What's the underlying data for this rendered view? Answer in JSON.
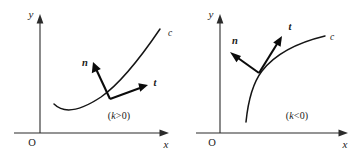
{
  "figure": {
    "background_color": "#ffffff",
    "axis_color": "#2b2b2b",
    "curve_color": "#151515",
    "vector_color": "#0b0b0b"
  },
  "panels": [
    {
      "id": "left",
      "condition_prefix": "(",
      "condition_symbol": "k",
      "condition_relation": ">0)",
      "condition_label": "(k>0)",
      "axes": {
        "x_label": "x",
        "y_label": "y",
        "origin_label": "O"
      },
      "curve_label": "c",
      "vectors": [
        {
          "name": "n",
          "label": "n"
        },
        {
          "name": "t",
          "label": "t"
        }
      ]
    },
    {
      "id": "right",
      "condition_prefix": "(",
      "condition_symbol": "k",
      "condition_relation": "<0)",
      "condition_label": "(k<0)",
      "axes": {
        "x_label": "x",
        "y_label": "y",
        "origin_label": "O"
      },
      "curve_label": "c",
      "vectors": [
        {
          "name": "n",
          "label": "n"
        },
        {
          "name": "t",
          "label": "t"
        }
      ]
    }
  ]
}
